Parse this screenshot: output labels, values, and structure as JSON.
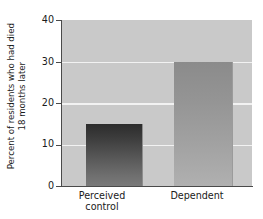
{
  "chart_data": {
    "type": "bar",
    "title": "",
    "xlabel": "",
    "ylabel_lines": [
      "Percent of residents who had died",
      "18 months later"
    ],
    "ylabel": "Percent of residents who had died 18 months later",
    "categories": [
      "Perceived control",
      "Dependent"
    ],
    "category_lines": [
      [
        "Perceived",
        "control"
      ],
      [
        "Dependent"
      ]
    ],
    "values": [
      15,
      30
    ],
    "ylim": [
      0,
      40
    ],
    "yticks": [
      0,
      10,
      20,
      30,
      40
    ],
    "ytick_labels": [
      "0",
      "10",
      "20",
      "30",
      "40"
    ],
    "grid": true,
    "grid_axis": "y",
    "grid_color": "#f2f2f2",
    "legend": null,
    "plot_background": "#c9c9c9",
    "bar_colors": [
      "#3c3c3c",
      "#949494"
    ],
    "axis_color": "#4a4a4a",
    "text_color": "#1a1a1a"
  }
}
